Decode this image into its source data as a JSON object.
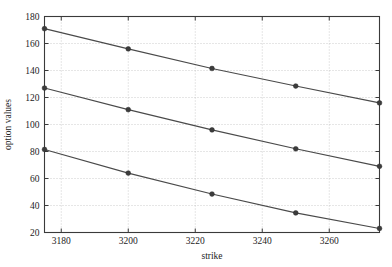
{
  "chart_data": {
    "type": "line",
    "title": "",
    "subtitle": "",
    "xlabel": "strike",
    "ylabel": "option values",
    "x": [
      3175,
      3200,
      3225,
      3250,
      3275
    ],
    "xlim": [
      3175,
      3275
    ],
    "ylim": [
      20,
      180
    ],
    "xticks": [
      3180,
      3200,
      3220,
      3240,
      3260
    ],
    "xtick_labels": [
      "3180",
      "3200",
      "3220",
      "3240",
      "3260"
    ],
    "yticks": [
      20,
      40,
      60,
      80,
      100,
      120,
      140,
      160,
      180
    ],
    "ytick_labels": [
      "20",
      "40",
      "60",
      "80",
      "100",
      "120",
      "140",
      "160",
      "180"
    ],
    "grid": true,
    "grid_style": "dotted",
    "legend": false,
    "legend_position": "none",
    "marker": "circle",
    "series": [
      {
        "name": "series-1",
        "values": [
          171,
          156,
          141.5,
          128.5,
          116
        ],
        "color": "#4a4a4a"
      },
      {
        "name": "series-2",
        "values": [
          127,
          111,
          96,
          82,
          69
        ],
        "color": "#4a4a4a"
      },
      {
        "name": "series-3",
        "values": [
          81.5,
          64,
          48.5,
          34.5,
          23
        ],
        "color": "#4a4a4a"
      }
    ],
    "annotations": []
  },
  "axes": {
    "x_axis_label": "strike",
    "y_axis_label": "option values"
  },
  "colors": {
    "line": "#4a4a4a",
    "marker": "#3c3c3c",
    "grid": "#b9b9b9",
    "axis": "#3a3a3a",
    "text": "#1c1c1c",
    "background": "#ffffff"
  }
}
